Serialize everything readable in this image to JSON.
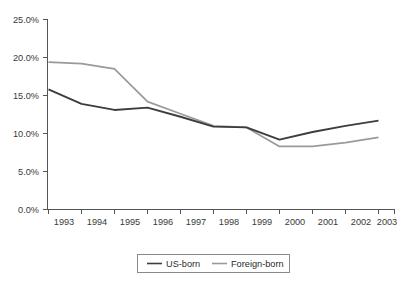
{
  "chart_data": {
    "type": "line",
    "title": "",
    "subtitle": "",
    "xlabel": "",
    "ylabel": "",
    "categories": [
      "1993",
      "1994",
      "1995",
      "1996",
      "1997",
      "1998",
      "1999",
      "2000",
      "2001",
      "2002",
      "2003"
    ],
    "x": [
      1993,
      1994,
      1995,
      1996,
      1997,
      1998,
      1999,
      2000,
      2001,
      2002,
      2003
    ],
    "series": [
      {
        "name": "US-born",
        "color": "#3d3d3d",
        "values": [
          15.8,
          13.9,
          13.1,
          13.4,
          12.2,
          10.9,
          10.8,
          9.2,
          10.2,
          11.0,
          11.7
        ]
      },
      {
        "name": "Foreign-born",
        "color": "#9a9a9a",
        "values": [
          19.4,
          19.2,
          18.5,
          14.2,
          12.6,
          11.0,
          10.8,
          8.3,
          8.3,
          8.8,
          9.5
        ]
      }
    ],
    "ylim": [
      0,
      25
    ],
    "yticks": [
      0,
      5,
      10,
      15,
      20,
      25
    ],
    "ytick_labels": [
      "0.0%",
      "5.0%",
      "10.0%",
      "15.0%",
      "20.0%",
      "25.0%"
    ],
    "xtick_labels": [
      "1993",
      "1994",
      "1995",
      "1996",
      "1997",
      "1998",
      "1999",
      "2000",
      "2001",
      "2002",
      "2003"
    ],
    "grid": false,
    "legend_position": "bottom-center",
    "legend_entries": [
      "US-born",
      "Foreign-born"
    ]
  },
  "axis": {
    "y_labels": {
      "t0": "0.0%",
      "t1": "5.0%",
      "t2": "10.0%",
      "t3": "15.0%",
      "t4": "20.0%",
      "t5": "25.0%"
    },
    "x_labels": {
      "y0": "1993",
      "y1": "1994",
      "y2": "1995",
      "y3": "1996",
      "y4": "1997",
      "y5": "1998",
      "y6": "1999",
      "y7": "2000",
      "y8": "2001",
      "y9": "2002",
      "y10": "2003"
    }
  },
  "legend": {
    "entry_1": "US-born",
    "entry_2": "Foreign-born"
  },
  "colors": {
    "us_born": "#3d3d3d",
    "foreign_born": "#9a9a9a",
    "axis": "#555555",
    "legend_border": "#8a8a8a",
    "background": "#ffffff"
  }
}
